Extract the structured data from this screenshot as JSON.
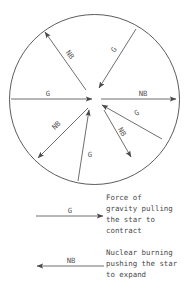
{
  "figure": {
    "star": {
      "name": "star-circle",
      "center_x": 94.5,
      "center_y": 99.5,
      "radius": 85,
      "stroke": "#4a4a4a"
    },
    "arrows": [
      {
        "id": "arrow-left-gravity",
        "label": "G",
        "meaning": "gravity",
        "direction": "inward",
        "x1": 11,
        "y1": 99,
        "x2": 92,
        "y2": 99,
        "label_x": 48,
        "label_y": 95
      },
      {
        "id": "arrow-right-nuclear",
        "label": "NB",
        "meaning": "nuclear-burning",
        "direction": "outward",
        "x1": 101,
        "y1": 99,
        "x2": 177,
        "y2": 99,
        "label_x": 143,
        "label_y": 95
      },
      {
        "id": "arrow-upper-left-nuclear",
        "label": "NB",
        "meaning": "nuclear-burning",
        "direction": "outward",
        "x1": 86,
        "y1": 90,
        "x2": 45,
        "y2": 32,
        "label_x": 68,
        "label_y": 55
      },
      {
        "id": "arrow-upper-right-gravity",
        "label": "G",
        "meaning": "gravity",
        "direction": "inward",
        "x1": 136,
        "y1": 29,
        "x2": 99,
        "y2": 88,
        "label_x": 116,
        "label_y": 50
      },
      {
        "id": "arrow-lower-left-nuclear",
        "label": "NB",
        "meaning": "nuclear-burning",
        "direction": "outward",
        "x1": 88,
        "y1": 108,
        "x2": 38,
        "y2": 158,
        "label_x": 58,
        "label_y": 128
      },
      {
        "id": "arrow-bottom-gravity",
        "label": "G",
        "meaning": "gravity",
        "direction": "inward",
        "x1": 78,
        "y1": 181,
        "x2": 89,
        "y2": 110,
        "label_x": 90,
        "label_y": 155
      },
      {
        "id": "arrow-lower-right-nuclear",
        "label": "NB",
        "meaning": "nuclear-burning",
        "direction": "outward",
        "x1": 104,
        "y1": 110,
        "x2": 131,
        "y2": 157,
        "label_x": 121,
        "label_y": 135
      },
      {
        "id": "arrow-right-lower-gravity",
        "label": "G",
        "meaning": "gravity",
        "direction": "inward",
        "x1": 162,
        "y1": 139,
        "x2": 102,
        "y2": 105,
        "label_x": 138,
        "label_y": 115
      }
    ]
  },
  "legend": {
    "gravity": {
      "symbol": "G",
      "arrow_direction": "right",
      "arrow_x1": 36,
      "arrow_x2": 104,
      "arrow_y": 216,
      "lines": [
        "Force of",
        "gravity pulling",
        "the star to",
        "contract"
      ]
    },
    "nuclear": {
      "symbol": "NB",
      "arrow_direction": "left",
      "arrow_x1": 104,
      "arrow_x2": 36,
      "arrow_y": 266,
      "lines": [
        "Nuclear burning",
        "pushing the star",
        "to expand"
      ]
    }
  },
  "colors": {
    "stroke": "#4a4a4a",
    "text": "#4a4a4a",
    "background": "#ffffff"
  }
}
